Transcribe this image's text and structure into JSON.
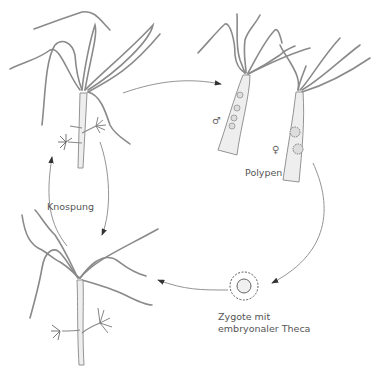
{
  "diagram": {
    "type": "life-cycle",
    "labels": {
      "budding": "Knospung",
      "polyps": "Polypen",
      "male_symbol": "♂",
      "female_symbol": "♀",
      "zygote_line1": "Zygote mit",
      "zygote_line2": "embryonaler Theca"
    },
    "colors": {
      "line": "#777777",
      "tentacle": "#8a8a8a",
      "body_fill": "#eeeeee",
      "text": "#555555",
      "arrow": "#333333"
    },
    "stages": [
      {
        "id": "polyp-with-buds-top",
        "position": "top-left"
      },
      {
        "id": "male-polyp",
        "position": "top-right-left"
      },
      {
        "id": "female-polyp",
        "position": "top-right-right"
      },
      {
        "id": "zygote",
        "position": "bottom-right"
      },
      {
        "id": "polyp-with-buds-bottom",
        "position": "bottom-left"
      }
    ],
    "arrows": [
      {
        "from": "polyp-with-buds-top",
        "to": "male-polyp"
      },
      {
        "from": "female-polyp",
        "to": "zygote"
      },
      {
        "from": "zygote",
        "to": "polyp-with-buds-bottom"
      },
      {
        "from": "polyp-with-buds-bottom",
        "to": "polyp-with-buds-top",
        "label": "Knospung"
      },
      {
        "from": "polyp-with-buds-top",
        "to": "polyp-with-buds-bottom",
        "label": "Knospung"
      }
    ]
  }
}
